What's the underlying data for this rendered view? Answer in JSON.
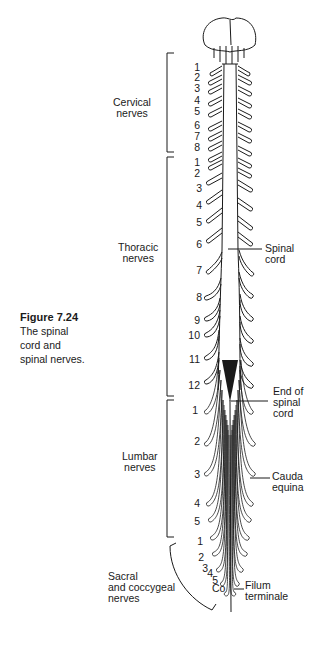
{
  "caption": {
    "figure_number": "Figure 7.24",
    "lines": [
      "The spinal",
      "cord and",
      "spinal nerves."
    ]
  },
  "groups": [
    {
      "name": "cervical",
      "label_lines": [
        "Cervical",
        "nerves"
      ],
      "numbers": [
        "1",
        "2",
        "3",
        "4",
        "5",
        "6",
        "7",
        "8"
      ]
    },
    {
      "name": "thoracic",
      "label_lines": [
        "Thoracic",
        "nerves"
      ],
      "numbers": [
        "1",
        "2",
        "3",
        "4",
        "5",
        "6",
        "7",
        "8",
        "9",
        "10",
        "11",
        "12"
      ]
    },
    {
      "name": "lumbar",
      "label_lines": [
        "Lumbar",
        "nerves"
      ],
      "numbers": [
        "1",
        "2",
        "3",
        "4",
        "5"
      ]
    },
    {
      "name": "sacral",
      "label_lines": [
        "Sacral",
        "and coccygeal",
        "nerves"
      ],
      "numbers": [
        "1",
        "2",
        "3",
        "4",
        "5",
        "Co"
      ]
    }
  ],
  "callouts": {
    "spinal_cord": [
      "Spinal",
      "cord"
    ],
    "end_of_cord": [
      "End of",
      "spinal",
      "cord"
    ],
    "cauda_equina": [
      "Cauda",
      "equina"
    ],
    "filum_terminale": [
      "Filum",
      "terminale"
    ]
  },
  "colors": {
    "ink": "#1a1a1a",
    "background": "#ffffff"
  }
}
